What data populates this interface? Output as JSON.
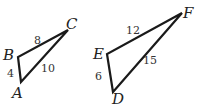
{
  "diagram": {
    "type": "similar-triangles",
    "triangles": [
      {
        "name": "ABC",
        "vertices": {
          "A": {
            "label": "A",
            "x": 21,
            "y": 82
          },
          "B": {
            "label": "B",
            "x": 18,
            "y": 57
          },
          "C": {
            "label": "C",
            "x": 68,
            "y": 30
          }
        },
        "sides": {
          "AB": "4",
          "BC": "8",
          "AC": "10"
        }
      },
      {
        "name": "DEF",
        "vertices": {
          "D": {
            "label": "D",
            "x": 113,
            "y": 92
          },
          "E": {
            "label": "E",
            "x": 107,
            "y": 54
          },
          "F": {
            "label": "F",
            "x": 182,
            "y": 13
          }
        },
        "sides": {
          "DE": "6",
          "EF": "12",
          "DF": "15"
        }
      }
    ],
    "stroke_color": "#1a1a1a",
    "background": "#ffffff"
  }
}
